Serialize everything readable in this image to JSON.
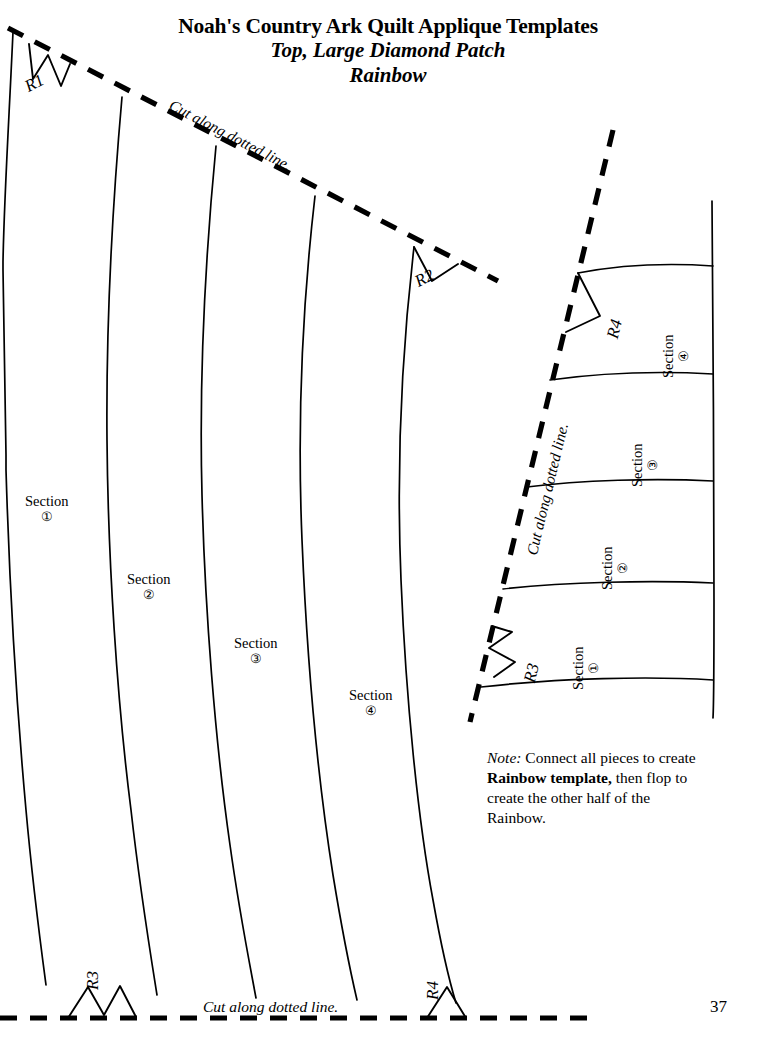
{
  "document": {
    "title_main": "Noah's Country Ark Quilt Applique Templates",
    "title_sub1": "Top, Large Diamond Patch",
    "title_sub2": "Rainbow",
    "page_number": "37"
  },
  "cut_lines": {
    "top_diagonal_label": "Cut along dotted line.",
    "bottom_horizontal_label": "Cut along dotted line.",
    "right_diagonal_label": "Cut along dotted line."
  },
  "registration_marks": [
    {
      "id": "R1",
      "label": "R1",
      "shape": "zigzag-w",
      "panel": "left",
      "edge": "top"
    },
    {
      "id": "R2",
      "label": "R2",
      "shape": "notch-v",
      "panel": "left",
      "edge": "top"
    },
    {
      "id": "R3-bottom",
      "label": "R3",
      "shape": "peak-m",
      "panel": "left",
      "edge": "bottom"
    },
    {
      "id": "R4-bottom",
      "label": "R4",
      "shape": "peak-triangle",
      "panel": "left",
      "edge": "bottom"
    },
    {
      "id": "R3-right",
      "label": "R3",
      "shape": "zigzag-w",
      "panel": "right",
      "edge": "diagonal"
    },
    {
      "id": "R4-right",
      "label": "R4",
      "shape": "notch-v",
      "panel": "right",
      "edge": "diagonal"
    }
  ],
  "left_panel": {
    "name": "Large rainbow arc template",
    "sections": [
      {
        "label": "Section",
        "number": "①"
      },
      {
        "label": "Section",
        "number": "②"
      },
      {
        "label": "Section",
        "number": "③"
      },
      {
        "label": "Section",
        "number": "④"
      }
    ]
  },
  "right_panel": {
    "name": "Rainbow band continuation template",
    "sections": [
      {
        "label": "Section",
        "number": "①"
      },
      {
        "label": "Section",
        "number": "②"
      },
      {
        "label": "Section",
        "number": "③"
      },
      {
        "label": "Section",
        "number": "④"
      }
    ]
  },
  "note": {
    "head": "Note:",
    "text_1": " Connect all pieces to create ",
    "bold": "Rainbow template,",
    "text_2": " then flop to create the other half of the Rainbow."
  },
  "colors": {
    "ink": "#000000",
    "paper": "#ffffff"
  }
}
